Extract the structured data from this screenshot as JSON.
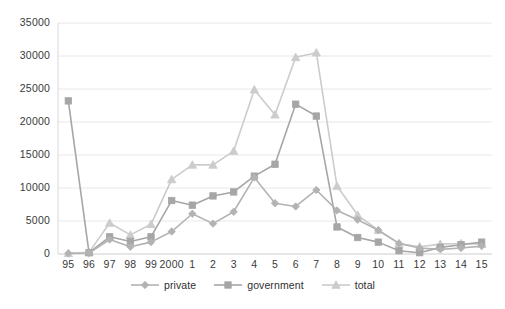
{
  "chart_data": {
    "type": "line",
    "title": "",
    "subtitle": "",
    "xlabel": "",
    "ylabel": "",
    "categories": [
      "95",
      "96",
      "97",
      "98",
      "99",
      "2000",
      "1",
      "2",
      "3",
      "4",
      "5",
      "6",
      "7",
      "8",
      "9",
      "10",
      "11",
      "12",
      "13",
      "14",
      "15"
    ],
    "ylim": [
      0,
      35000
    ],
    "ytick_labels": [
      "35000",
      "30000",
      "25000",
      "20000",
      "15000",
      "10000",
      "5000",
      "0"
    ],
    "ytick_values": [
      35000,
      30000,
      25000,
      20000,
      15000,
      10000,
      5000,
      0
    ],
    "grid": true,
    "grid_axis": "y",
    "legend_position": "bottom",
    "series": [
      {
        "name": "private",
        "marker": "diamond",
        "color": "#b3b3b3",
        "values": [
          100,
          150,
          2200,
          1100,
          1800,
          3400,
          6100,
          4600,
          6400,
          11600,
          7700,
          7200,
          9700,
          6600,
          5200,
          3600,
          1600,
          900,
          700,
          900,
          1200
        ]
      },
      {
        "name": "government",
        "marker": "square",
        "color": "#a6a6a6",
        "values": [
          23200,
          200,
          2600,
          1900,
          2600,
          8100,
          7400,
          8800,
          9400,
          11800,
          13600,
          22700,
          20900,
          4100,
          2500,
          1800,
          500,
          200,
          1000,
          1400,
          1800
        ]
      },
      {
        "name": "total",
        "marker": "triangle",
        "color": "#cccccc",
        "values": [
          100,
          250,
          4700,
          2900,
          4500,
          11300,
          13500,
          13500,
          15600,
          24900,
          21100,
          29800,
          30500,
          10300,
          5900,
          3600,
          1600,
          1100,
          1500,
          1600,
          1500
        ]
      }
    ]
  },
  "legend": {
    "items": [
      {
        "label": "private"
      },
      {
        "label": "government"
      },
      {
        "label": "total"
      }
    ]
  },
  "axes": {
    "y_axis_name": "value-axis",
    "x_axis_name": "year-axis"
  },
  "colors": {
    "grid": "#e8e8ec",
    "axis_text": "#3a3a3a",
    "plot_background": "#ffffff"
  }
}
